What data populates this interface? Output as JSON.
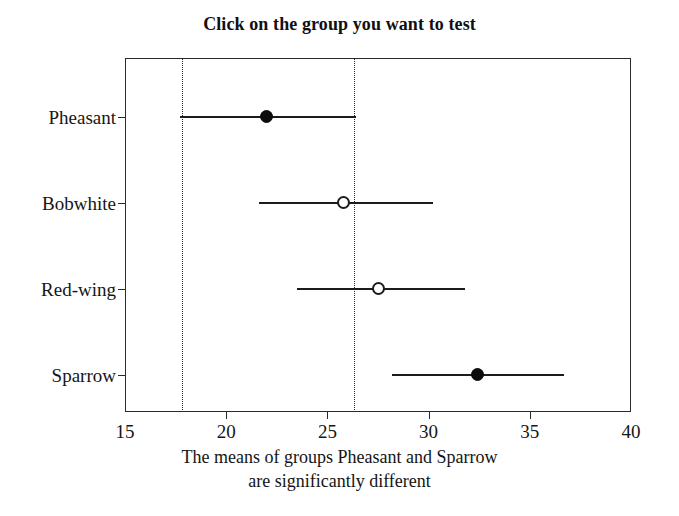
{
  "chart_data": {
    "type": "scatter",
    "title": "Click on the group you want to test",
    "xlabel": "",
    "ylabel": "",
    "xlim": [
      15,
      40
    ],
    "xticks": [
      15,
      20,
      25,
      30,
      35,
      40
    ],
    "xticklabels": [
      "15",
      "20",
      "25",
      "30",
      "35",
      "40"
    ],
    "categories": [
      "Pheasant",
      "Bobwhite",
      "Red-wing",
      "Sparrow"
    ],
    "grid": false,
    "legend": null,
    "reference_lines": [
      17.8,
      26.3
    ],
    "reference_line_style": "dotted",
    "series": [
      {
        "name": "group means with comparison intervals",
        "points": [
          {
            "group": "Pheasant",
            "mean": 22.0,
            "ci_low": 17.7,
            "ci_high": 26.4,
            "marker": "filled",
            "highlighted": true
          },
          {
            "group": "Bobwhite",
            "mean": 25.8,
            "ci_low": 21.6,
            "ci_high": 30.2,
            "marker": "open",
            "highlighted": false
          },
          {
            "group": "Red-wing",
            "mean": 27.5,
            "ci_low": 23.5,
            "ci_high": 31.8,
            "marker": "open",
            "highlighted": false
          },
          {
            "group": "Sparrow",
            "mean": 32.4,
            "ci_low": 28.2,
            "ci_high": 36.7,
            "marker": "filled",
            "highlighted": true
          }
        ]
      }
    ],
    "annotations": [
      "The means of groups Pheasant and Sparrow",
      "are significantly different"
    ]
  },
  "caption": {
    "line1": "The means of groups Pheasant and Sparrow",
    "line2": "are significantly different"
  },
  "colors": {
    "axis": "#2a2a2a",
    "marker_filled": "#0d0d0d",
    "marker_open_edge": "#1c1c1c",
    "interval": "#1c1c1c",
    "reference": "#2a2a2a",
    "background": "#ffffff"
  }
}
